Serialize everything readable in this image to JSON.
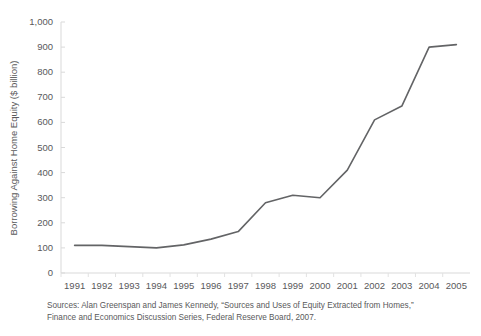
{
  "chart_data": {
    "type": "line",
    "title": "",
    "xlabel": "",
    "ylabel": "Borrowing Against Home Equity ($ billion)",
    "categories": [
      "1991",
      "1992",
      "1993",
      "1994",
      "1995",
      "1996",
      "1997",
      "1998",
      "1999",
      "2000",
      "2001",
      "2002",
      "2003",
      "2004",
      "2005"
    ],
    "values": [
      110,
      110,
      105,
      100,
      112,
      135,
      165,
      280,
      310,
      300,
      410,
      610,
      665,
      900,
      910
    ],
    "series": [
      {
        "name": "Borrowing Against Home Equity",
        "values": [
          110,
          110,
          105,
          100,
          112,
          135,
          165,
          280,
          310,
          300,
          410,
          610,
          665,
          900,
          910
        ]
      }
    ],
    "ylim": [
      0,
      1000
    ],
    "yticks": [
      0,
      100,
      200,
      300,
      400,
      500,
      600,
      700,
      800,
      900,
      1000
    ],
    "ytick_labels": [
      "0",
      "100",
      "200",
      "300",
      "400",
      "500",
      "600",
      "700",
      "800",
      "900",
      "1,000"
    ],
    "grid": false,
    "legend": "none",
    "line_color": "#636466",
    "axis_color": "#d9d9d9",
    "text_color": "#59595b"
  },
  "source_note": "Sources: Alan Greenspan and James Kennedy, “Sources and Uses of Equity Extracted from Homes,”\nFinance and Economics Discussion Series, Federal Reserve Board, 2007."
}
